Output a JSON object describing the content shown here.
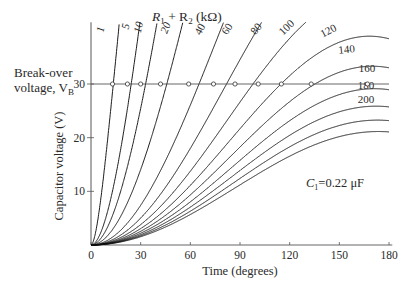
{
  "chart_data": {
    "type": "line",
    "title": "",
    "legend_title": "R1 + R2 (kΩ)",
    "xlabel": "Time (degrees)",
    "ylabel": "Capacitor voltage (V)",
    "xlim": [
      0,
      180
    ],
    "ylim": [
      0,
      40
    ],
    "xticks": [
      0,
      30,
      60,
      90,
      120,
      150,
      180
    ],
    "yticks": [
      10,
      20,
      30
    ],
    "grid": false,
    "annotation_left": [
      "Break-over",
      "voltage, V",
      "B"
    ],
    "annotation_c1": "C1=0.22 μF",
    "breakover_voltage": 30,
    "series_labels_kohm": [
      1,
      5,
      10,
      20,
      40,
      60,
      80,
      100,
      120,
      140,
      160,
      180,
      200
    ],
    "breakover_crossing_deg": {
      "1": 13,
      "5": 22,
      "10": 30,
      "20": 42,
      "40": 59,
      "60": 74,
      "80": 87,
      "100": 101,
      "120": 115,
      "140": 133,
      "160": 167
    },
    "end_voltage_at_180deg": {
      "120": 37.5,
      "140": 33.5,
      "160": 30,
      "180": 26.8,
      "200": 24.2
    }
  },
  "labels": {
    "legend_title_r1": "R",
    "legend_title_sub1": "1",
    "legend_title_plus": " + R",
    "legend_title_sub2": "2",
    "legend_title_unit": " (kΩ)",
    "break_over_1": "Break-over",
    "break_over_2": "voltage, V",
    "break_over_sub": "B",
    "c1_c": "C",
    "c1_sub": "1",
    "c1_value": "=0.22 μF",
    "xlabel": "Time (degrees)",
    "ylabel": "Capacitor voltage (V)"
  }
}
